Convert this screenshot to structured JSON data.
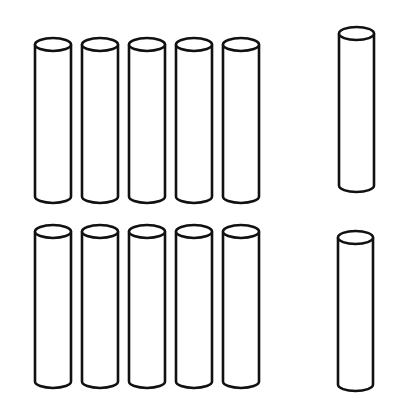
{
  "figure": {
    "stroke_color": "#111111",
    "fill_color": "#ffffff",
    "groups": [
      {
        "name": "row-1",
        "rods_left": [
          {
            "x": 35,
            "top": 38,
            "bottom": 203,
            "width": 36
          },
          {
            "x": 82,
            "top": 38,
            "bottom": 203,
            "width": 36
          },
          {
            "x": 129,
            "top": 38,
            "bottom": 203,
            "width": 36
          },
          {
            "x": 176,
            "top": 38,
            "bottom": 203,
            "width": 36
          },
          {
            "x": 223,
            "top": 38,
            "bottom": 203,
            "width": 36
          }
        ],
        "rod_right": {
          "x": 339,
          "top": 27,
          "bottom": 192,
          "width": 35
        }
      },
      {
        "name": "row-2",
        "rods_left": [
          {
            "x": 35,
            "top": 225,
            "bottom": 388,
            "width": 36
          },
          {
            "x": 82,
            "top": 225,
            "bottom": 388,
            "width": 36
          },
          {
            "x": 129,
            "top": 225,
            "bottom": 388,
            "width": 36
          },
          {
            "x": 176,
            "top": 225,
            "bottom": 388,
            "width": 36
          },
          {
            "x": 223,
            "top": 225,
            "bottom": 388,
            "width": 36
          }
        ],
        "rod_right": {
          "x": 338,
          "top": 231,
          "bottom": 391,
          "width": 35
        }
      }
    ]
  }
}
